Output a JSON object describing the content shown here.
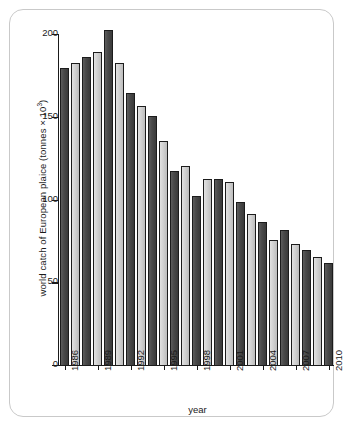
{
  "chart_data": {
    "type": "bar",
    "title": "",
    "xlabel": "year",
    "ylabel_text": "world catch of European plaice (tonnes × 10",
    "ylabel_sup": "3",
    "ylabel_close": ")",
    "ylim": [
      0,
      210
    ],
    "yticks": [
      0,
      50,
      100,
      150,
      200
    ],
    "ytick_labels": [
      "0",
      "50",
      "100",
      "150",
      "200"
    ],
    "grid": false,
    "legend": "none",
    "xtick_labels": [
      "1986",
      "1989",
      "1992",
      "1995",
      "1998",
      "2001",
      "2004",
      "2007",
      "2010"
    ],
    "categories": [
      "1986",
      "1987",
      "1988",
      "1989",
      "1990",
      "1991",
      "1992",
      "1993",
      "1994",
      "1995",
      "1996",
      "1997",
      "1998",
      "1999",
      "2000",
      "2001",
      "2002",
      "2003",
      "2004",
      "2005",
      "2006",
      "2007",
      "2008",
      "2009",
      "2010"
    ],
    "values": [
      180,
      183,
      187,
      190,
      203,
      183,
      165,
      157,
      151,
      136,
      118,
      121,
      103,
      113,
      113,
      111,
      99,
      92,
      87,
      76,
      82,
      74,
      70,
      66,
      62
    ],
    "bar_shades": [
      "dark",
      "light",
      "dark",
      "light",
      "dark",
      "light",
      "dark",
      "light",
      "dark",
      "light",
      "dark",
      "light",
      "dark",
      "light",
      "dark",
      "light",
      "dark",
      "light",
      "dark",
      "light",
      "dark",
      "light",
      "dark",
      "light",
      "dark"
    ],
    "colors": {
      "dark_bar": "#454545",
      "light_bar": "#d4d4d4",
      "bar_outline": "#1c1c1c",
      "axis": "#1a1a1a",
      "frame_border": "#c9c9c9",
      "background": "#ffffff"
    }
  }
}
